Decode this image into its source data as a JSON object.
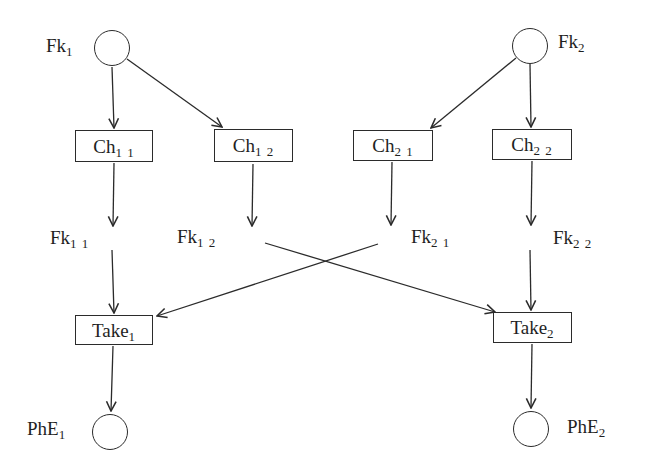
{
  "diagram": {
    "type": "petri-net",
    "background": "#ffffff",
    "line_color": "#2b2b2b",
    "places": {
      "fk1": {
        "base": "Fk",
        "sub": "1"
      },
      "fk2": {
        "base": "Fk",
        "sub": "2"
      },
      "phe1": {
        "base": "PhE",
        "sub": "1"
      },
      "phe2": {
        "base": "PhE",
        "sub": "2"
      }
    },
    "transitions": {
      "ch11": {
        "base": "Ch",
        "sub": "1 1"
      },
      "ch12": {
        "base": "Ch",
        "sub": "1 2"
      },
      "ch21": {
        "base": "Ch",
        "sub": "2 1"
      },
      "ch22": {
        "base": "Ch",
        "sub": "2 2"
      },
      "take1": {
        "base": "Take",
        "sub": "1"
      },
      "take2": {
        "base": "Take",
        "sub": "2"
      }
    },
    "mid_labels": {
      "fk11": {
        "base": "Fk",
        "sub": "1 1"
      },
      "fk12": {
        "base": "Fk",
        "sub": "1 2"
      },
      "fk21": {
        "base": "Fk",
        "sub": "2 1"
      },
      "fk22": {
        "base": "Fk",
        "sub": "2 2"
      }
    },
    "arcs": [
      {
        "from": "Fk1",
        "to": "Ch11"
      },
      {
        "from": "Fk1",
        "to": "Ch12"
      },
      {
        "from": "Fk2",
        "to": "Ch21"
      },
      {
        "from": "Fk2",
        "to": "Ch22"
      },
      {
        "from": "Ch11",
        "to": "Fk11"
      },
      {
        "from": "Ch12",
        "to": "Fk12"
      },
      {
        "from": "Ch21",
        "to": "Fk21"
      },
      {
        "from": "Ch22",
        "to": "Fk22"
      },
      {
        "from": "Fk11",
        "to": "Take1"
      },
      {
        "from": "Fk12",
        "to": "Take2"
      },
      {
        "from": "Fk21",
        "to": "Take1"
      },
      {
        "from": "Fk22",
        "to": "Take2"
      },
      {
        "from": "Take1",
        "to": "PhE1"
      },
      {
        "from": "Take2",
        "to": "PhE2"
      }
    ]
  }
}
